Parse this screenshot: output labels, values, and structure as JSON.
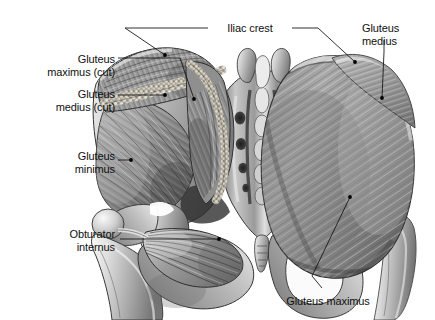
{
  "figure": {
    "kind": "anatomical-illustration",
    "width": 435,
    "height": 320,
    "background_color": "#ffffff",
    "text_color": "#101010",
    "leader_color": "#1a1a1a",
    "style": "grayscale pen-and-ink / airbrush medical illustration"
  },
  "labels": [
    {
      "id": "iliac-crest",
      "text": "Iliac crest",
      "align": "center",
      "x": 215,
      "y": 22,
      "width": 70
    },
    {
      "id": "gluteus-medius-right",
      "text": "Gluteus\nmedius",
      "align": "left",
      "x": 362,
      "y": 22,
      "width": 70
    },
    {
      "id": "gluteus-maximus-cut",
      "text": "Gluteus\nmaximus (cut)",
      "align": "right",
      "x": 10,
      "y": 53,
      "width": 105
    },
    {
      "id": "gluteus-medius-cut",
      "text": "Gluteus\nmedius (cut)",
      "align": "right",
      "x": 10,
      "y": 88,
      "width": 105
    },
    {
      "id": "gluteus-minimus",
      "text": "Gluteus\nminimus",
      "align": "right",
      "x": 10,
      "y": 150,
      "width": 105
    },
    {
      "id": "obturator-internus",
      "text": "Obturator\ninternus",
      "align": "right",
      "x": 8,
      "y": 228,
      "width": 107
    },
    {
      "id": "gluteus-maximus-bottom",
      "text": "Gluteus maximus",
      "align": "center",
      "x": 268,
      "y": 295,
      "width": 120
    }
  ],
  "leaders": [
    {
      "id": "leader-iliac-crest-left",
      "path": "M 208 28 L 125 28 L 165 55",
      "dot": [
        165,
        55
      ]
    },
    {
      "id": "leader-iliac-crest-right",
      "path": "M 292 28 L 318 28 L 355 62",
      "dot": [
        355,
        62
      ]
    },
    {
      "id": "leader-gluteus-medius-right",
      "path": "M 384 40 L 384 52 L 382 98",
      "dot": [
        382,
        98
      ]
    },
    {
      "id": "leader-gluteus-maximus-cut",
      "path": "M 118 58 L 180 58 L 194 99",
      "dot": [
        194,
        99
      ]
    },
    {
      "id": "leader-gluteus-medius-cut",
      "path": "M 118 95 L 165 95",
      "dot": [
        165,
        95
      ]
    },
    {
      "id": "leader-gluteus-minimus",
      "path": "M 118 160 L 131 160",
      "dot": [
        131,
        160
      ]
    },
    {
      "id": "leader-obturator-internus",
      "path": "M 120 239 L 219 239",
      "dot": [
        219,
        239
      ]
    },
    {
      "id": "leader-gluteus-maximus-bottom",
      "path": "M 322 288 L 312 276 L 350 197",
      "dot": [
        350,
        197
      ]
    }
  ],
  "structures": [
    {
      "id": "left-gluteus-maximus-flap",
      "name": "Gluteus maximus (reflected / cut)",
      "side": "left"
    },
    {
      "id": "left-gluteus-medius-flap",
      "name": "Gluteus medius (reflected / cut)",
      "side": "left"
    },
    {
      "id": "left-gluteus-minimus",
      "name": "Gluteus minimus",
      "side": "left"
    },
    {
      "id": "left-ilium",
      "name": "Ilium with iliac crest",
      "side": "left"
    },
    {
      "id": "left-femur",
      "name": "Femur, head, neck and greater trochanter",
      "side": "left"
    },
    {
      "id": "obturator-internus-muscle",
      "name": "Obturator internus",
      "side": "left"
    },
    {
      "id": "sacrum",
      "name": "Sacrum with median sacral crest and four pairs of posterior sacral foramina",
      "side": "center"
    },
    {
      "id": "coccyx",
      "name": "Coccyx",
      "side": "center"
    },
    {
      "id": "right-gluteus-maximus",
      "name": "Gluteus maximus (intact)",
      "side": "right"
    },
    {
      "id": "right-gluteus-medius",
      "name": "Gluteus medius (superior portion)",
      "side": "right"
    },
    {
      "id": "right-obturator-foramen",
      "name": "Obturator foramen",
      "side": "right"
    },
    {
      "id": "right-femur",
      "name": "Femur, greater trochanter",
      "side": "right"
    }
  ]
}
